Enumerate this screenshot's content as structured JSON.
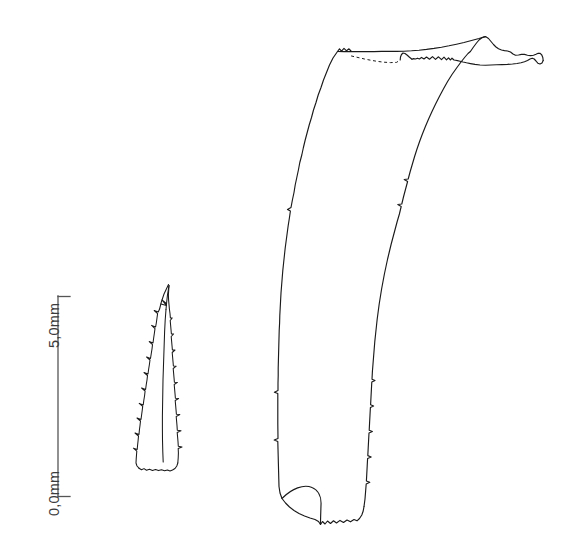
{
  "figure": {
    "kind": "scientific-line-drawing",
    "background_color": "#ffffff",
    "ink_color": "#1a1a1a",
    "scale_bar": {
      "name": "vertical-scale-bar",
      "orientation": "vertical",
      "label_rotation_deg": -90,
      "top_label": "5,0mm",
      "bottom_label": "0,0mm",
      "units": "mm",
      "span_value": 5.0,
      "tick_direction": "right",
      "line_color": "#555555"
    },
    "specimens": [
      {
        "name": "small-specimen",
        "label": "",
        "description": "slender tapering spine with serrated barbed margins, blunt rounded base, pointed apex",
        "apex": "top",
        "base": "bottom"
      },
      {
        "name": "large-specimen",
        "label": "",
        "description": "elongate curved chaeta with hooked apex bearing a lateral flange, dotted occluded margin near apex, blunt base with internal fold line",
        "apex": "top-right",
        "base": "bottom"
      }
    ]
  }
}
